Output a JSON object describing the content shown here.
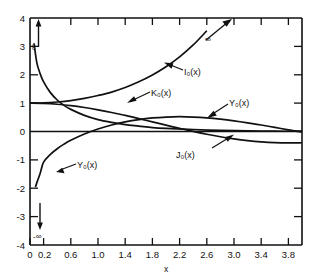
{
  "chart_data": {
    "type": "line",
    "title": "",
    "xlabel": "x",
    "ylabel": "",
    "xlim": [
      0,
      4
    ],
    "ylim": [
      -4,
      4
    ],
    "grid": false,
    "legend_position": "inline-annotations",
    "xticks": [
      0,
      0.2,
      0.6,
      1.0,
      1.4,
      1.8,
      2.2,
      2.6,
      3.0,
      3.4,
      3.8
    ],
    "xticklabels": [
      "0",
      "0.2",
      "0.6",
      "1.0",
      "1.4",
      "1.8",
      "2.2",
      "2.6",
      "3.0",
      "3.4",
      "3.8"
    ],
    "yticks": [
      -4,
      -3,
      -2,
      -1,
      0,
      1,
      2,
      3,
      4
    ],
    "yticklabels": [
      "-4",
      "-3",
      "-2",
      "-1",
      "0",
      "1",
      "2",
      "3",
      "4"
    ],
    "annotations": [
      {
        "name": "infinity-up-left",
        "text": "∞",
        "at_x": 0.08,
        "at_y": 3.9,
        "arrow": "up"
      },
      {
        "name": "infinity-neg-bottom",
        "text": "-∞",
        "at_x": 0.1,
        "at_y": -3.55,
        "arrow": "down"
      },
      {
        "name": "infinity-up-right",
        "text": "∞",
        "at_x": 2.85,
        "at_y": 3.45,
        "arrow": "up-right"
      }
    ],
    "series": [
      {
        "name": "K_0(x)",
        "label": "K₀(x)",
        "label_x": 1.45,
        "label_y": 1.42,
        "x": [
          0.06,
          0.1,
          0.15,
          0.2,
          0.3,
          0.4,
          0.5,
          0.6,
          0.8,
          1.0,
          1.2,
          1.4,
          1.6,
          1.8,
          2.0,
          2.4,
          2.8,
          3.2,
          3.6,
          4.0
        ],
        "y": [
          3.11,
          2.43,
          2.03,
          1.75,
          1.37,
          1.11,
          0.92,
          0.78,
          0.57,
          0.42,
          0.32,
          0.24,
          0.19,
          0.14,
          0.11,
          0.07,
          0.04,
          0.02,
          0.01,
          0.01
        ]
      },
      {
        "name": "I_0(x)",
        "label": "I₀(x)",
        "label_x": 2.0,
        "label_y": 2.1,
        "x": [
          0,
          0.2,
          0.4,
          0.6,
          0.8,
          1.0,
          1.2,
          1.4,
          1.6,
          1.8,
          2.0,
          2.2,
          2.4,
          2.6,
          2.8,
          3.0
        ],
        "y": [
          1.0,
          1.01,
          1.04,
          1.09,
          1.17,
          1.27,
          1.39,
          1.55,
          1.75,
          1.99,
          2.28,
          2.63,
          3.05,
          3.55,
          4.16,
          4.88
        ]
      },
      {
        "name": "J_0(x)",
        "label": "J₀(x)",
        "label_x": 2.15,
        "label_y": -0.95,
        "x": [
          0,
          0.2,
          0.4,
          0.6,
          0.8,
          1.0,
          1.2,
          1.4,
          1.6,
          1.8,
          2.0,
          2.2,
          2.4,
          2.6,
          2.8,
          3.0,
          3.2,
          3.4,
          3.6,
          3.8,
          4.0
        ],
        "y": [
          1.0,
          0.99,
          0.96,
          0.912,
          0.846,
          0.765,
          0.671,
          0.567,
          0.455,
          0.34,
          0.224,
          0.11,
          0.003,
          -0.097,
          -0.185,
          -0.26,
          -0.32,
          -0.364,
          -0.392,
          -0.403,
          -0.397
        ]
      },
      {
        "name": "Y_0(x)",
        "label": "Y₀(x)",
        "label_x": 2.58,
        "label_y": 0.82,
        "label2": "Y₀(x)",
        "label2_x": 0.52,
        "label2_y": -1.22,
        "x": [
          0.08,
          0.1,
          0.15,
          0.2,
          0.3,
          0.4,
          0.5,
          0.6,
          0.8,
          1.0,
          1.2,
          1.4,
          1.6,
          1.8,
          2.0,
          2.2,
          2.4,
          2.6,
          2.8,
          3.0,
          3.2,
          3.4,
          3.6,
          3.8,
          4.0
        ],
        "y": [
          -1.96,
          -1.81,
          -1.47,
          -1.08,
          -0.807,
          -0.606,
          -0.445,
          -0.309,
          -0.087,
          0.088,
          0.228,
          0.338,
          0.42,
          0.477,
          0.51,
          0.521,
          0.51,
          0.481,
          0.436,
          0.377,
          0.307,
          0.229,
          0.145,
          0.059,
          -0.017
        ]
      }
    ]
  }
}
